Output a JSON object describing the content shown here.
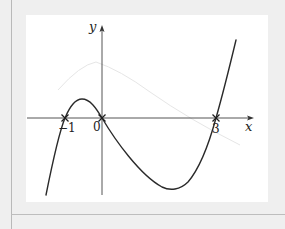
{
  "figure": {
    "x_axis_label": "x",
    "y_axis_label": "y",
    "tick_labels": [
      "-1",
      "0",
      "3"
    ],
    "roots": [
      -1,
      0,
      3
    ],
    "root_marker": "cross",
    "curve_color": "#2a2a2a",
    "axis_color": "#555555"
  },
  "labels": {
    "x": "x",
    "y": "y",
    "root_neg1": "−1",
    "root_0": "0",
    "root_3": "3"
  }
}
